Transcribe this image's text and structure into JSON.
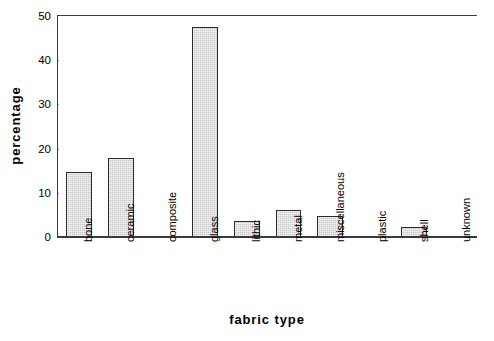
{
  "chart_data": {
    "type": "bar",
    "title": "",
    "xlabel": "fabric type",
    "ylabel": "percentage",
    "categories": [
      "bone",
      "ceramic",
      "composite",
      "glass",
      "lithic",
      "metal",
      "miscellaneous",
      "plastic",
      "shell",
      "unknown"
    ],
    "values": [
      14.8,
      17.8,
      0,
      47.5,
      3.6,
      6.1,
      4.7,
      0,
      2.2,
      0
    ],
    "ylim": [
      0,
      50
    ],
    "yticks": [
      0,
      10,
      20,
      30,
      40,
      50
    ],
    "ytick_labels": [
      "0",
      "10",
      "20",
      "30",
      "40",
      "50"
    ],
    "grid": "horizontal-dotted",
    "legend": "none",
    "bar_face_color": "#c9c9c9",
    "bar_edge_color": "#2b2b2b",
    "axis_color": "#3a3a3a",
    "gridline_color": "#9a9a9a",
    "background_color": "#ffffff"
  }
}
